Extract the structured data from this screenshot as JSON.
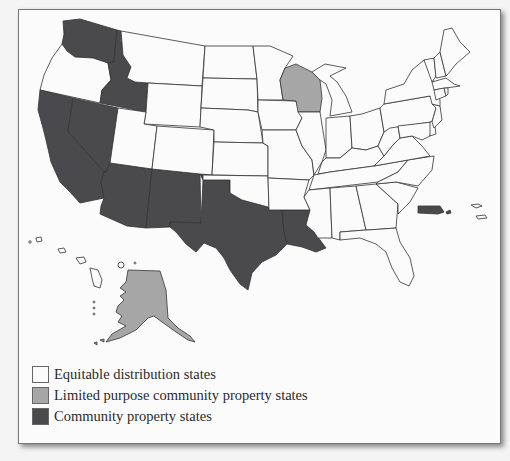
{
  "figure": {
    "type": "choropleth-map",
    "region": "United States",
    "colors": {
      "equitable": "#fbfbfb",
      "limited": "#a6a6a6",
      "community": "#4a4a4c",
      "border": "#333333"
    }
  },
  "legend": {
    "items": [
      {
        "label": "Equitable distribution states",
        "color": "#fbfbfb"
      },
      {
        "label": "Limited purpose community property states",
        "color": "#a6a6a6"
      },
      {
        "label": "Community property states",
        "color": "#4a4a4c"
      }
    ]
  },
  "categories": {
    "community_property_states": [
      "Washington",
      "Idaho",
      "Nevada",
      "California",
      "Arizona",
      "New Mexico",
      "Texas",
      "Louisiana",
      "Puerto Rico"
    ],
    "limited_purpose_community_property_states": [
      "Wisconsin",
      "Alaska"
    ],
    "equitable_distribution_states": "All other states (incl. Hawaii)"
  }
}
